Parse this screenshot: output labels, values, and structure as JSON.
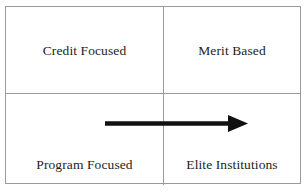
{
  "diagram": {
    "type": "2x2-matrix",
    "quadrants": [
      {
        "position": "top-left",
        "label": "Credit Focused"
      },
      {
        "position": "top-right",
        "label": "Merit Based"
      },
      {
        "position": "bottom-left",
        "label": "Program Focused"
      },
      {
        "position": "bottom-right",
        "label": "Elite Institutions"
      }
    ],
    "annotations": [
      {
        "kind": "arrow",
        "name": "progression-arrow",
        "direction": "right",
        "from_quadrant": "bottom-left",
        "to_quadrant": "bottom-right",
        "color": "#111111"
      }
    ],
    "colors": {
      "border": "#9a9a9a",
      "background": "#ffffff",
      "text": "#1d1d1d",
      "arrow": "#111111"
    }
  }
}
